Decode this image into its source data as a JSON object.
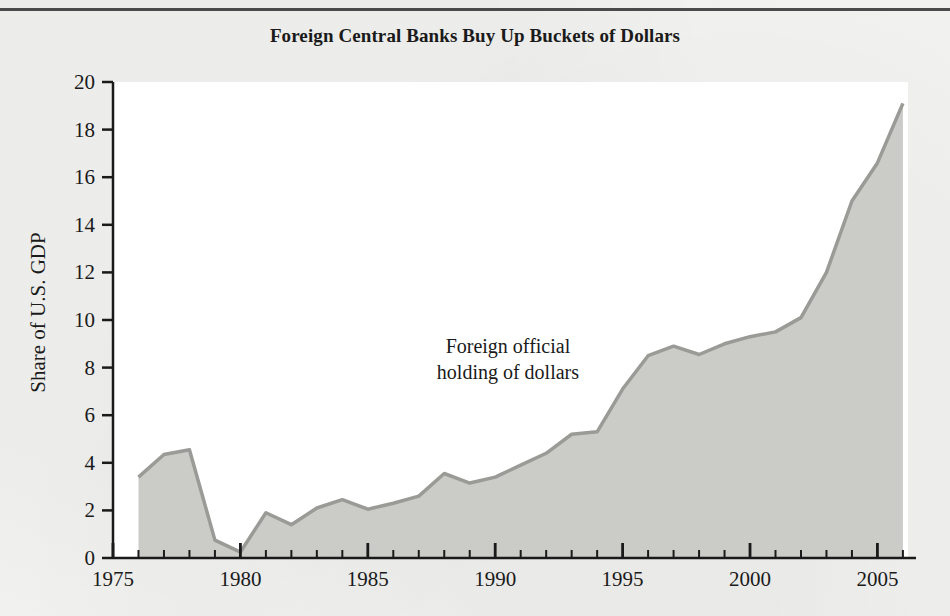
{
  "figure": {
    "title": "Foreign Central Banks Buy Up Buckets of Dollars",
    "annotation_line1": "Foreign official",
    "annotation_line2": "holding of dollars",
    "area_fill_color": "#cbcbc7",
    "area_line_color": "#9a9a96",
    "axis_color": "#1a1a1a",
    "plot_background": "#ffffff",
    "page_background": "#f2f2f0"
  },
  "chart_data": {
    "type": "area",
    "title": "Foreign Central Banks Buy Up Buckets of Dollars",
    "xlabel": "",
    "ylabel": "Share of U.S. GDP",
    "xlim": [
      1975,
      2006.2
    ],
    "ylim": [
      0,
      20
    ],
    "grid": false,
    "legend": "none",
    "annotations": [
      {
        "text": "Foreign official holding of dollars",
        "x": 1990.5,
        "y": 8.6
      }
    ],
    "x_major_ticks": [
      1975,
      1980,
      1985,
      1990,
      1995,
      2000,
      2005
    ],
    "x_major_tick_labels": [
      "1975",
      "1980",
      "1985",
      "1990",
      "1995",
      "2000",
      "2005"
    ],
    "x_minor_tick_step": 1,
    "y_ticks": [
      0,
      2,
      4,
      6,
      8,
      10,
      12,
      14,
      16,
      18,
      20
    ],
    "y_tick_labels": [
      "0",
      "2",
      "4",
      "6",
      "8",
      "10",
      "12",
      "14",
      "16",
      "18",
      "20"
    ],
    "series": [
      {
        "name": "Foreign official holding of dollars",
        "x": [
          1976,
          1977,
          1978,
          1979,
          1980,
          1981,
          1982,
          1983,
          1984,
          1985,
          1986,
          1987,
          1988,
          1989,
          1990,
          1991,
          1992,
          1993,
          1994,
          1995,
          1996,
          1997,
          1998,
          1999,
          2000,
          2001,
          2002,
          2003,
          2004,
          2005,
          2006
        ],
        "values": [
          3.4,
          4.35,
          4.55,
          0.75,
          0.25,
          1.9,
          1.4,
          2.1,
          2.45,
          2.05,
          2.3,
          2.6,
          3.55,
          3.15,
          3.4,
          3.9,
          4.4,
          5.2,
          5.3,
          7.1,
          8.5,
          8.9,
          8.55,
          9.0,
          9.3,
          9.5,
          10.1,
          12.0,
          15.0,
          16.6,
          19.1
        ]
      }
    ]
  }
}
